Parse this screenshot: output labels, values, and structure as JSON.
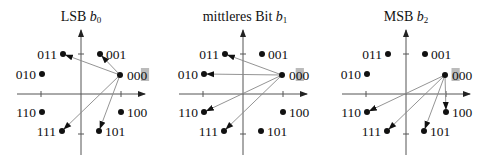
{
  "figure": {
    "background": "#ffffff",
    "axis_color": "#555555",
    "arrow_color": "#888888",
    "point_color": "#111111",
    "highlight_color": "#bbbbbb",
    "origin_symbol": "000",
    "panels": [
      {
        "id": "lsb",
        "title_prefix": "LSB ",
        "title_var": "b",
        "title_sub": "0",
        "origin_x": 81,
        "highlight_digit": 2,
        "arrow_targets": [
          "001",
          "011",
          "111",
          "101"
        ]
      },
      {
        "id": "mid",
        "title_prefix": "mittleres Bit ",
        "title_var": "b",
        "title_sub": "1",
        "origin_x": 243,
        "highlight_digit": 1,
        "arrow_targets": [
          "011",
          "010",
          "110",
          "111"
        ]
      },
      {
        "id": "msb",
        "title_prefix": "MSB ",
        "title_var": "b",
        "title_sub": "2",
        "origin_x": 406,
        "highlight_digit": 0,
        "arrow_targets": [
          "110",
          "111",
          "101",
          "100"
        ]
      }
    ],
    "axis": {
      "origin_y": 94,
      "x_left": -64,
      "x_right": 64,
      "y_top": -64,
      "y_bottom": 61,
      "tick": 40
    },
    "points": [
      {
        "label": "000",
        "dx": 39,
        "dy": -19,
        "label_side": "right"
      },
      {
        "label": "001",
        "dx": 19,
        "dy": -40,
        "label_side": "right"
      },
      {
        "label": "011",
        "dx": -18,
        "dy": -40,
        "label_side": "left"
      },
      {
        "label": "010",
        "dx": -39,
        "dy": -20,
        "label_side": "left"
      },
      {
        "label": "110",
        "dx": -39,
        "dy": 18,
        "label_side": "left"
      },
      {
        "label": "111",
        "dx": -19,
        "dy": 37,
        "label_side": "left"
      },
      {
        "label": "101",
        "dx": 18,
        "dy": 37,
        "label_side": "right"
      },
      {
        "label": "100",
        "dx": 40,
        "dy": 18,
        "label_side": "right"
      }
    ]
  }
}
